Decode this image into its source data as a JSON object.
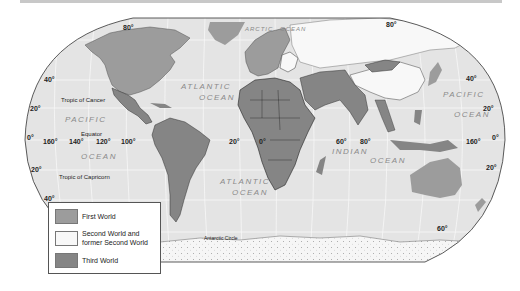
{
  "map": {
    "title": "First, Second, and Third World countries",
    "colors": {
      "ocean": "#e4e4e4",
      "first_world": "#9c9c9c",
      "second_world": "#f8f8f8",
      "third_world": "#858585",
      "border": "#333333",
      "antarctica": "#f4f4f4"
    },
    "latitude_labels": {
      "n80_left": "80°",
      "n80_right": "80°",
      "n40_left": "40°",
      "n40_right": "40°",
      "n20_left": "20°",
      "n20_right": "20°",
      "eq_left": "0°",
      "eq_right": "0°",
      "s20_left": "20°",
      "s20_right": "20°",
      "s40_left": "40°",
      "s60_right": "60°"
    },
    "longitude_labels": {
      "w160": "160°",
      "w140": "140°",
      "w120": "120°",
      "w100": "100°",
      "w20": "20°",
      "zero": "0°",
      "e60": "60°",
      "e80": "80°",
      "e160": "160°"
    },
    "line_labels": {
      "tropic_cancer": "Tropic of Cancer",
      "equator": "Equator",
      "tropic_capricorn": "Tropic of Capricorn",
      "antarctic_circle": "Antarctic Circle"
    },
    "ocean_labels": {
      "arctic_1": "ARCTIC",
      "arctic_2": "OCEAN",
      "atlantic_n1": "ATLANTIC",
      "atlantic_n2": "OCEAN",
      "atlantic_s1": "ATLANTIC",
      "atlantic_s2": "OCEAN",
      "pacific_w1": "PACIFIC",
      "pacific_w2": "OCEAN",
      "pacific_e1": "PACIFIC",
      "pacific_e2": "OCEAN",
      "indian_1": "INDIAN",
      "indian_2": "OCEAN"
    }
  },
  "legend": {
    "items": [
      {
        "label": "First World",
        "color": "#9c9c9c"
      },
      {
        "label": "Second World and former Second World",
        "line1": "Second World and",
        "line2": "former Second World",
        "color": "#f8f8f8"
      },
      {
        "label": "Third World",
        "color": "#858585"
      }
    ]
  }
}
